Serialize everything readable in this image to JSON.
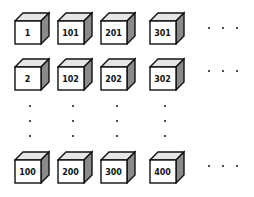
{
  "diagram": {
    "cubes": [
      {
        "label": "1",
        "x": 14,
        "y": 11
      },
      {
        "label": "101",
        "x": 57,
        "y": 11
      },
      {
        "label": "201",
        "x": 100,
        "y": 11
      },
      {
        "label": "301",
        "x": 149,
        "y": 11
      },
      {
        "label": "2",
        "x": 14,
        "y": 57
      },
      {
        "label": "102",
        "x": 57,
        "y": 57
      },
      {
        "label": "202",
        "x": 100,
        "y": 57
      },
      {
        "label": "302",
        "x": 149,
        "y": 57
      },
      {
        "label": "100",
        "x": 14,
        "y": 150
      },
      {
        "label": "200",
        "x": 57,
        "y": 150
      },
      {
        "label": "300",
        "x": 100,
        "y": 150
      },
      {
        "label": "400",
        "x": 149,
        "y": 150
      }
    ],
    "ellipsis": "..."
  }
}
